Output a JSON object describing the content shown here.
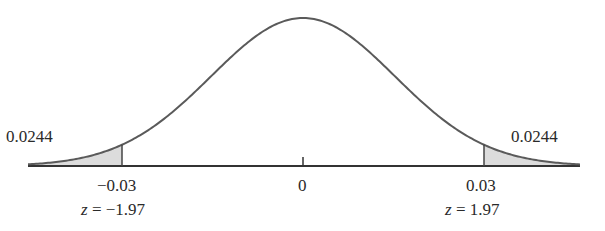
{
  "chart_data": {
    "type": "area",
    "title": "",
    "xlabel": "",
    "ylabel": "",
    "grid": false,
    "legend": null,
    "center": {
      "value": "0",
      "x": 0
    },
    "tails": [
      {
        "side": "left",
        "cutoff": "-0.03",
        "z_label": "z = −1.97",
        "z": -1.97,
        "area": "0.0244"
      },
      {
        "side": "right",
        "cutoff": "0.03",
        "z_label": "z = 1.97",
        "z": 1.97,
        "area": "0.0244"
      }
    ],
    "tick_labels": [
      "−0.03",
      "0",
      "0.03"
    ],
    "colors": {
      "curve": "#555555",
      "shade": "#d9d9d9",
      "axis": "#333333"
    }
  },
  "labels": {
    "left_area": "0.0244",
    "right_area": "0.0244",
    "left_tick": "−0.03",
    "center_tick": "0",
    "right_tick": "0.03",
    "left_z_prefix": "z",
    "left_z_value": " = −1.97",
    "right_z_prefix": "z",
    "right_z_value": " = 1.97"
  }
}
